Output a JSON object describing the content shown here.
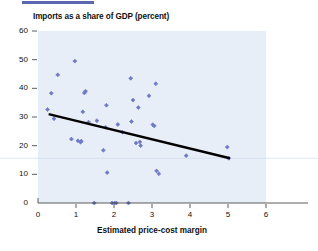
{
  "chart_data": {
    "type": "scatter",
    "title": "Imports as a share of GDP (percent)",
    "xlabel": "Estimated price-cost margin",
    "ylabel": "",
    "xlim": [
      0,
      6
    ],
    "ylim": [
      0,
      60
    ],
    "xticks": [
      "0",
      "1",
      "2",
      "3",
      "4",
      "5",
      "6"
    ],
    "yticks": [
      "0",
      "10",
      "20",
      "30",
      "40",
      "50",
      "60"
    ],
    "grid": false,
    "legend": null,
    "point_color": "#6e79c4",
    "trendline_color": "#000000",
    "plot_background": "#e8eef8",
    "points": [
      {
        "x": 0.25,
        "y": 32.6
      },
      {
        "x": 0.35,
        "y": 38.3
      },
      {
        "x": 0.42,
        "y": 29.4
      },
      {
        "x": 0.52,
        "y": 44.7
      },
      {
        "x": 0.88,
        "y": 22.3
      },
      {
        "x": 0.97,
        "y": 49.5
      },
      {
        "x": 1.05,
        "y": 21.7
      },
      {
        "x": 1.12,
        "y": 21.2
      },
      {
        "x": 1.14,
        "y": 21.6
      },
      {
        "x": 1.18,
        "y": 31.8
      },
      {
        "x": 1.22,
        "y": 38.4
      },
      {
        "x": 1.25,
        "y": 39.0
      },
      {
        "x": 1.33,
        "y": 28.2
      },
      {
        "x": 1.48,
        "y": 0.0
      },
      {
        "x": 1.55,
        "y": 28.7
      },
      {
        "x": 1.72,
        "y": 18.4
      },
      {
        "x": 1.78,
        "y": 26.4
      },
      {
        "x": 1.8,
        "y": 34.1
      },
      {
        "x": 1.82,
        "y": 10.6
      },
      {
        "x": 1.95,
        "y": 0.0
      },
      {
        "x": 2.02,
        "y": 0.0
      },
      {
        "x": 2.06,
        "y": 0.0
      },
      {
        "x": 2.1,
        "y": 27.4
      },
      {
        "x": 2.22,
        "y": 24.7
      },
      {
        "x": 2.38,
        "y": 0.0
      },
      {
        "x": 2.44,
        "y": 43.5
      },
      {
        "x": 2.46,
        "y": 28.4
      },
      {
        "x": 2.5,
        "y": 35.9
      },
      {
        "x": 2.58,
        "y": 20.9
      },
      {
        "x": 2.64,
        "y": 33.3
      },
      {
        "x": 2.68,
        "y": 21.3
      },
      {
        "x": 2.7,
        "y": 20.0
      },
      {
        "x": 2.92,
        "y": 37.4
      },
      {
        "x": 3.02,
        "y": 27.3
      },
      {
        "x": 3.06,
        "y": 26.9
      },
      {
        "x": 3.1,
        "y": 41.6
      },
      {
        "x": 3.12,
        "y": 11.2
      },
      {
        "x": 3.18,
        "y": 10.2
      },
      {
        "x": 3.9,
        "y": 16.5
      },
      {
        "x": 4.98,
        "y": 19.5
      },
      {
        "x": 5.02,
        "y": 15.6
      }
    ],
    "trendline": {
      "x1": 0.28,
      "y1": 31.0,
      "x2": 5.05,
      "y2": 15.6
    }
  }
}
